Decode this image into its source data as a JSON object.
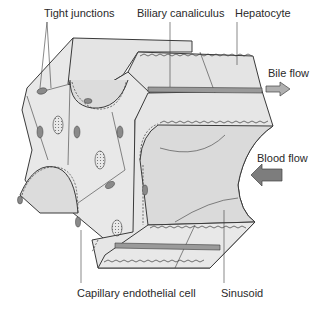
{
  "figure": {
    "type": "liver lobule / hepatic plate diagram",
    "labels": {
      "tight_junctions": "Tight junctions",
      "biliary_canaliculus": "Biliary canaliculus",
      "hepatocyte": "Hepatocyte",
      "bile_flow": "Bile flow",
      "blood_flow": "Blood flow",
      "capillary_endothelial_cell": "Capillary endothelial cell",
      "sinusoid": "Sinusoid"
    },
    "arrows": {
      "bile_flow_direction": "right",
      "blood_flow_direction": "left"
    },
    "colors": {
      "background": "#ffffff",
      "tissue_fill": "#e4e4e4",
      "tissue_fill_light": "#eeeeee",
      "outline": "#3a3a3a",
      "canaliculus": "#9a9a9a",
      "arrow_fill": "#8c8c8c",
      "text": "#2a2a2a"
    }
  }
}
